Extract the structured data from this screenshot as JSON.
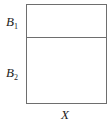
{
  "diagram": {
    "type": "partitioned-rectangle",
    "rows": [
      {
        "label_base": "B",
        "label_sub": "1"
      },
      {
        "label_base": "B",
        "label_sub": "2"
      }
    ],
    "bottom_label": "X",
    "line_color": "#6e6e6e"
  }
}
